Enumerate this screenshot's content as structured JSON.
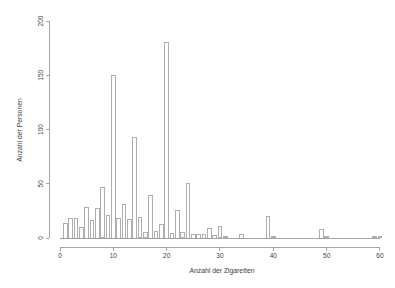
{
  "chart_data": {
    "type": "bar",
    "title": "",
    "subtitle": "",
    "xlabel": "Anzahl der Zigaretten",
    "ylabel": "Anzahl der Personen",
    "xlim": [
      0,
      60
    ],
    "ylim": [
      0,
      200
    ],
    "x_ticks": [
      0,
      10,
      20,
      30,
      40,
      50,
      60
    ],
    "y_ticks": [
      0,
      50,
      100,
      150,
      200
    ],
    "grid": false,
    "legend": null,
    "bar_color": "#ffffff",
    "bar_border_color": "#9a9a9a",
    "axis_color": "#9a9a9a",
    "text_color": "#3d3d3d",
    "x": [
      1,
      2,
      3,
      4,
      5,
      6,
      7,
      8,
      9,
      10,
      11,
      12,
      13,
      14,
      15,
      16,
      17,
      18,
      19,
      20,
      21,
      22,
      23,
      24,
      25,
      26,
      27,
      28,
      29,
      30,
      31,
      32,
      33,
      34,
      35,
      36,
      37,
      38,
      39,
      40,
      41,
      42,
      43,
      44,
      45,
      46,
      47,
      48,
      49,
      50,
      51,
      52,
      53,
      54,
      55,
      56,
      57,
      58,
      59,
      60
    ],
    "values": [
      13,
      18,
      18,
      10,
      28,
      16,
      27,
      47,
      21,
      150,
      18,
      31,
      17,
      93,
      19,
      5,
      39,
      6,
      12,
      180,
      4,
      25,
      5,
      50,
      3,
      3,
      3,
      9,
      2,
      11,
      1,
      0,
      0,
      3,
      0,
      0,
      0,
      0,
      20,
      1,
      0,
      0,
      0,
      0,
      0,
      0,
      0,
      0,
      8,
      1,
      0,
      0,
      0,
      0,
      0,
      0,
      0,
      0,
      1,
      1
    ],
    "categories": [
      "1",
      "2",
      "3",
      "4",
      "5",
      "6",
      "7",
      "8",
      "9",
      "10",
      "11",
      "12",
      "13",
      "14",
      "15",
      "16",
      "17",
      "18",
      "19",
      "20",
      "21",
      "22",
      "23",
      "24",
      "25",
      "26",
      "27",
      "28",
      "29",
      "30",
      "31",
      "32",
      "33",
      "34",
      "35",
      "36",
      "37",
      "38",
      "39",
      "40",
      "41",
      "42",
      "43",
      "44",
      "45",
      "46",
      "47",
      "48",
      "49",
      "50",
      "51",
      "52",
      "53",
      "54",
      "55",
      "56",
      "57",
      "58",
      "59",
      "60"
    ]
  }
}
